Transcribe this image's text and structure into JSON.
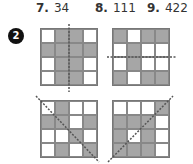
{
  "answers": [
    {
      "number": "7.",
      "value": "34"
    },
    {
      "number": "8.",
      "value": "111"
    },
    {
      "number": "9.",
      "value": "422"
    }
  ],
  "problem_badge": "2",
  "grids": [
    {
      "name": "top-left",
      "symmetry_line": "vertical",
      "cells": [
        [
          "w",
          "g",
          "g",
          "w"
        ],
        [
          "g",
          "g",
          "g",
          "g"
        ],
        [
          "w",
          "g",
          "g",
          "w"
        ],
        [
          "w",
          "g",
          "g",
          "w"
        ]
      ]
    },
    {
      "name": "top-right",
      "symmetry_line": "horizontal",
      "cells": [
        [
          "g",
          "w",
          "g",
          "g"
        ],
        [
          "w",
          "g",
          "w",
          "w"
        ],
        [
          "w",
          "g",
          "w",
          "w"
        ],
        [
          "g",
          "w",
          "g",
          "g"
        ]
      ]
    },
    {
      "name": "bottom-left",
      "symmetry_line": "diagonal-down",
      "cells": [
        [
          "w",
          "g",
          "w",
          "w"
        ],
        [
          "g",
          "g",
          "w",
          "g"
        ],
        [
          "w",
          "w",
          "g",
          "w"
        ],
        [
          "w",
          "g",
          "w",
          "g"
        ]
      ]
    },
    {
      "name": "bottom-right",
      "symmetry_line": "diagonal-up",
      "cells": [
        [
          "w",
          "w",
          "w",
          "g"
        ],
        [
          "g",
          "g",
          "g",
          "w"
        ],
        [
          "g",
          "w",
          "g",
          "w"
        ],
        [
          "g",
          "g",
          "g",
          "w"
        ]
      ]
    }
  ],
  "colors": {
    "shaded": "#a6a6a6",
    "badge": "#111111"
  }
}
